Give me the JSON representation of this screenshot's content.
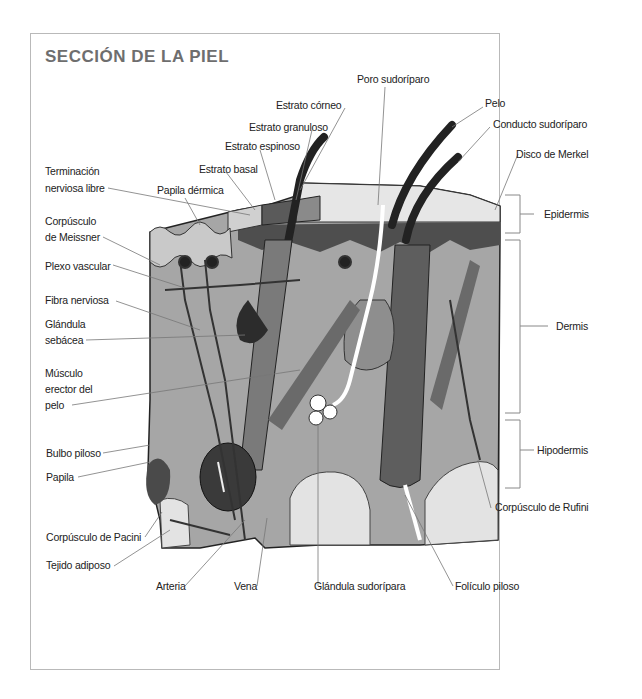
{
  "title": "SECCIÓN DE LA PIEL",
  "labels": {
    "poro_sudoriparo": "Poro sudoríparo",
    "estrato_corneo": "Estrato córneo",
    "estrato_granuloso": "Estrato granuloso",
    "estrato_espinoso": "Estrato espinoso",
    "estrato_basal": "Estrato basal",
    "terminacion_l1": "Terminación",
    "terminacion_l2": "nerviosa libre",
    "papila_dermica": "Papila dérmica",
    "pelo": "Pelo",
    "conducto_sudoriparo": "Conducto sudoríparo",
    "disco_merkel": "Disco de Merkel",
    "meissner_l1": "Corpúsculo",
    "meissner_l2": "de Meissner",
    "plexo_vascular": "Plexo vascular",
    "fibra_nerviosa": "Fibra nerviosa",
    "glandula_sebacea_l1": "Glándula",
    "glandula_sebacea_l2": "sebácea",
    "musculo_l1": "Músculo",
    "musculo_l2": "erector del",
    "musculo_l3": "pelo",
    "bulbo_piloso": "Bulbo piloso",
    "papila": "Papila",
    "pacini": "Corpúsculo de Pacini",
    "tejido_adiposo": "Tejido adiposo",
    "arteria": "Arteria",
    "vena": "Vena",
    "glandula_sudoripara": "Glándula sudorípara",
    "foliculo_piloso": "Folículo piloso",
    "rufini": "Corpúsculo de Rufini",
    "epidermis": "Epidermis",
    "dermis": "Dermis",
    "hipodermis": "Hipodermis"
  },
  "colors": {
    "title": "#6e6e6e",
    "frame": "#b9b9b9",
    "leader": "#777777",
    "dermis": "#a9a9a9",
    "epidermis": "#d4d4d4",
    "fat": "#e2e2e2",
    "vessel": "#3a3a3a"
  }
}
